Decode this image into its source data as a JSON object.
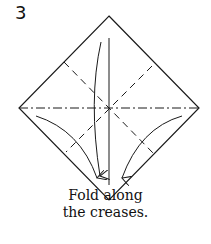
{
  "step_number": "3",
  "caption": {
    "line1": "Fold along",
    "line2": "the creases."
  },
  "diagram": {
    "shape": "square rotated 45 degrees (diamond)",
    "lines": [
      "mountain fold horizontal (dash-dot)",
      "vertical crease (solid)",
      "valley folds diagonal (dashed)"
    ],
    "arrows": 3,
    "stroke_color": "#1a1a1a"
  }
}
